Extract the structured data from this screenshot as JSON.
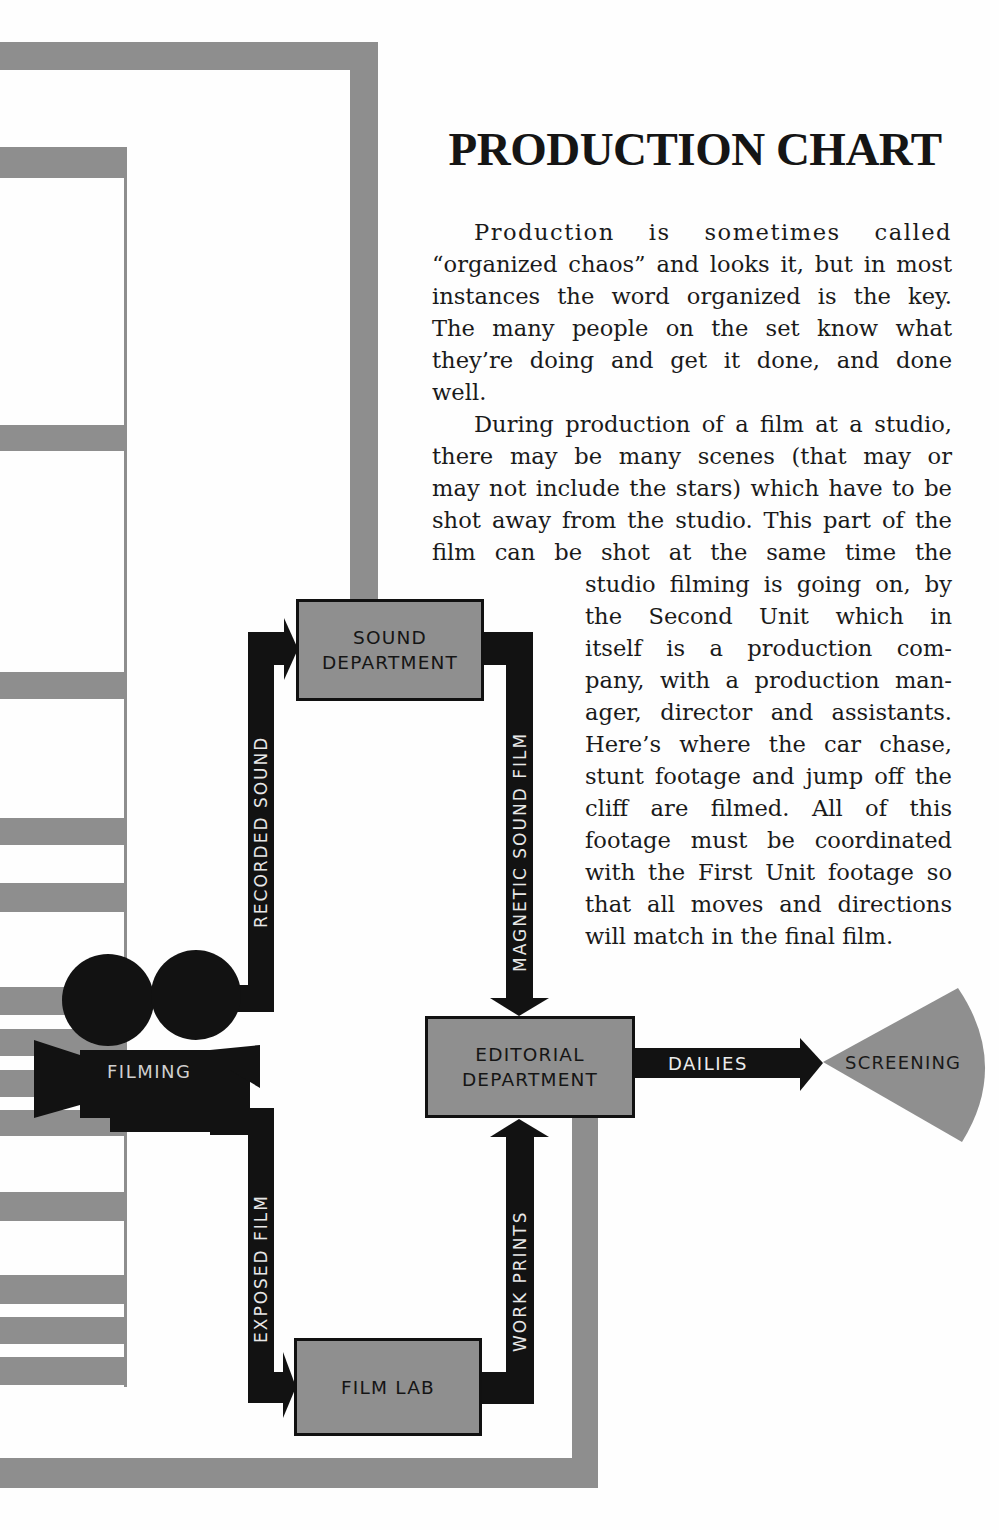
{
  "document": {
    "title": "PRODUCTION CHART",
    "paragraphs": [
      {
        "lines": [
          "Production is sometimes called",
          "“organized chaos” and looks it, but in most",
          "instances the word organized is the key.",
          "The many people on the set know what",
          "they’re doing and get it done, and done",
          "well."
        ]
      },
      {
        "lines_wide": [
          "During production of a film at a studio,",
          "there may be many scenes (that may or",
          "may not include the stars) which have to be",
          "shot away from the studio. This part of the",
          "film can be shot at the same time the"
        ],
        "lines_narrow": [
          "studio filming is going on, by",
          "the Second Unit which in",
          "itself is a production com-",
          "pany, with a production man-",
          "ager, director and assistants.",
          "Here’s where the car chase,",
          "stunt footage and jump off the",
          "cliff are filmed. All of this",
          "footage must be coordinated",
          "with the First Unit footage so",
          "that all moves and directions",
          "will match in the final film."
        ]
      }
    ]
  },
  "diagram": {
    "nodes": {
      "filming": {
        "label": "FILMING",
        "icon": "movie-camera-icon"
      },
      "sound_department": {
        "label_line1": "SOUND",
        "label_line2": "DEPARTMENT"
      },
      "editorial_department": {
        "label_line1": "EDITORIAL",
        "label_line2": "DEPARTMENT"
      },
      "film_lab": {
        "label": "FILM LAB"
      },
      "screening": {
        "label": "SCREENING",
        "icon": "projection-beam-icon"
      }
    },
    "edges": [
      {
        "from": "filming",
        "to": "sound_department",
        "label": "RECORDED SOUND"
      },
      {
        "from": "sound_department",
        "to": "editorial_department",
        "label": "MAGNETIC SOUND FILM"
      },
      {
        "from": "filming",
        "to": "film_lab",
        "label": "EXPOSED FILM"
      },
      {
        "from": "film_lab",
        "to": "editorial_department",
        "label": "WORK PRINTS"
      },
      {
        "from": "editorial_department",
        "to": "screening",
        "label": "DAILIES"
      }
    ],
    "colors": {
      "box_fill": "#8f8f8f",
      "arrow": "#121212",
      "frame": "#8e8e8e",
      "background": "#fefefe"
    }
  }
}
